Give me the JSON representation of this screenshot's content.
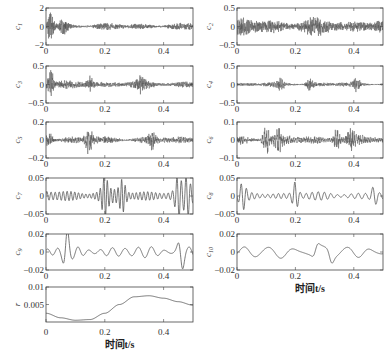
{
  "chart_data": {
    "type": "line",
    "title": "",
    "xlabel": "时间t/s",
    "x_range": [
      0,
      0.5
    ],
    "x_ticks": [
      0,
      0.2,
      0.4
    ],
    "x_tick_labels": [
      "0",
      "0.2",
      "0.4"
    ],
    "grid": false,
    "legend": "none",
    "line_color": "#555555",
    "panels": [
      {
        "id": "c1",
        "ylabel": "c1",
        "sub": "1",
        "ylim": [
          -2,
          2
        ],
        "yticks": [
          -2,
          0,
          2
        ],
        "ytick_labels": [
          "−2",
          "0",
          "2"
        ],
        "kind": "noise",
        "amp": 0.35,
        "burst": [
          [
            0.015,
            1.1
          ],
          [
            0.06,
            0.6
          ]
        ],
        "freq": 420,
        "col": 0,
        "row": 0,
        "show_xlabel": false
      },
      {
        "id": "c2",
        "ylabel": "c2",
        "sub": "2",
        "ylim": [
          -0.5,
          0.5
        ],
        "yticks": [
          -0.5,
          0,
          0.5
        ],
        "ytick_labels": [
          "−0.5",
          "0",
          "0.5"
        ],
        "kind": "noise",
        "amp": 0.22,
        "burst": [],
        "freq": 380,
        "col": 1,
        "row": 0,
        "show_xlabel": false
      },
      {
        "id": "c3",
        "ylabel": "c3",
        "sub": "3",
        "ylim": [
          -0.5,
          0.5
        ],
        "yticks": [
          -0.5,
          0,
          0.5
        ],
        "ytick_labels": [
          "−0.5",
          "0",
          "0.5"
        ],
        "kind": "noise",
        "amp": 0.1,
        "burst": [
          [
            0.015,
            0.3
          ],
          [
            0.15,
            0.18
          ],
          [
            0.32,
            0.15
          ]
        ],
        "freq": 300,
        "col": 0,
        "row": 1,
        "show_xlabel": false
      },
      {
        "id": "c4",
        "ylabel": "c4",
        "sub": "4",
        "ylim": [
          -0.5,
          0.5
        ],
        "yticks": [
          -0.5,
          0,
          0.5
        ],
        "ytick_labels": [
          "−0.5",
          "0",
          "0.5"
        ],
        "kind": "noise",
        "amp": 0.06,
        "burst": [
          [
            0.25,
            0.15
          ],
          [
            0.15,
            0.1
          ],
          [
            0.41,
            0.12
          ]
        ],
        "freq": 260,
        "col": 1,
        "row": 1,
        "show_xlabel": false
      },
      {
        "id": "c5",
        "ylabel": "c5",
        "sub": "5",
        "ylim": [
          -0.2,
          0.2
        ],
        "yticks": [
          -0.2,
          0,
          0.2
        ],
        "ytick_labels": [
          "−0.2",
          "0",
          "0.2"
        ],
        "kind": "noise",
        "amp": 0.04,
        "burst": [
          [
            0.145,
            0.12
          ],
          [
            0.01,
            0.07
          ],
          [
            0.36,
            0.06
          ]
        ],
        "freq": 180,
        "col": 0,
        "row": 2,
        "show_xlabel": false
      },
      {
        "id": "c6",
        "ylabel": "c6",
        "sub": "6",
        "ylim": [
          -0.1,
          0.1
        ],
        "yticks": [
          -0.1,
          0,
          0.1
        ],
        "ytick_labels": [
          "−0.1",
          "0",
          "0.1"
        ],
        "kind": "noise",
        "amp": 0.025,
        "burst": [
          [
            0.1,
            0.06
          ],
          [
            0.14,
            0.05
          ],
          [
            0.34,
            0.05
          ],
          [
            0.39,
            0.045
          ]
        ],
        "freq": 140,
        "col": 1,
        "row": 2,
        "show_xlabel": false
      },
      {
        "id": "c7",
        "ylabel": "c7",
        "sub": "7",
        "ylim": [
          -0.05,
          0.05
        ],
        "yticks": [
          -0.05,
          0,
          0.05
        ],
        "ytick_labels": [
          "−0.05",
          "0",
          "0.05"
        ],
        "kind": "wave",
        "amp": 0.02,
        "burst": [
          [
            0.2,
            0.04
          ],
          [
            0.26,
            0.035
          ],
          [
            0.45,
            0.045
          ],
          [
            0.48,
            0.04
          ]
        ],
        "freq": 72,
        "col": 0,
        "row": 3,
        "show_xlabel": false
      },
      {
        "id": "c8",
        "ylabel": "c8",
        "sub": "8",
        "ylim": [
          -0.05,
          0.05
        ],
        "yticks": [
          -0.05,
          0,
          0.05
        ],
        "ytick_labels": [
          "−0.05",
          "0",
          "0.05"
        ],
        "kind": "wave",
        "amp": 0.012,
        "burst": [
          [
            0.02,
            0.028
          ],
          [
            0.2,
            0.035
          ],
          [
            0.47,
            0.022
          ]
        ],
        "freq": 48,
        "col": 1,
        "row": 3,
        "show_xlabel": false
      },
      {
        "id": "c9",
        "ylabel": "c9",
        "sub": "9",
        "ylim": [
          -0.02,
          0.02
        ],
        "yticks": [
          -0.02,
          0,
          0.02
        ],
        "ytick_labels": [
          "−0.02",
          "0",
          "0.02"
        ],
        "kind": "wave",
        "amp": 0.007,
        "burst": [
          [
            0.07,
            0.019
          ],
          [
            0.46,
            0.018
          ]
        ],
        "freq": 26,
        "col": 0,
        "row": 4,
        "show_xlabel": false
      },
      {
        "id": "c10",
        "ylabel": "c10",
        "sub": "10",
        "ylim": [
          -0.02,
          0.02
        ],
        "yticks": [
          -0.02,
          0,
          0.02
        ],
        "ytick_labels": [
          "−0.02",
          "0",
          "0.02"
        ],
        "kind": "wave",
        "amp": 0.008,
        "burst": [
          [
            0.27,
            0.012
          ],
          [
            0.32,
            0.012
          ]
        ],
        "freq": 12.5,
        "col": 1,
        "row": 4,
        "show_xlabel": true
      },
      {
        "id": "r",
        "ylabel": "r",
        "sub": "",
        "ylim": [
          0,
          0.01
        ],
        "yticks": [
          0.005,
          0.01
        ],
        "ytick_labels": [
          "0.005",
          "0.01"
        ],
        "kind": "trend",
        "points": [
          [
            0,
            0.0025
          ],
          [
            0.05,
            0.0012
          ],
          [
            0.1,
            0.0005
          ],
          [
            0.15,
            0.0007
          ],
          [
            0.2,
            0.0025
          ],
          [
            0.25,
            0.005
          ],
          [
            0.3,
            0.0072
          ],
          [
            0.35,
            0.0075
          ],
          [
            0.4,
            0.0068
          ],
          [
            0.45,
            0.0058
          ],
          [
            0.5,
            0.0048
          ]
        ],
        "col": 0,
        "row": 5,
        "show_xlabel": true
      }
    ]
  },
  "figure": {
    "xlabel_text": "时间t/s"
  }
}
